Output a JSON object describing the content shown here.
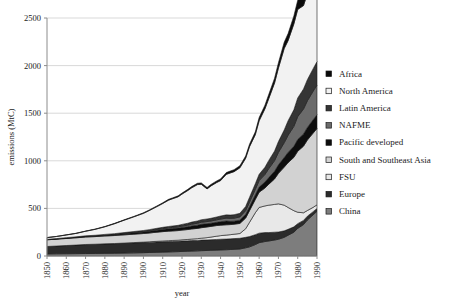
{
  "chart_data": {
    "type": "area",
    "stacked": true,
    "title": "",
    "xlabel": "year",
    "ylabel": "emissions (MtC)",
    "xlim": [
      1850,
      1990
    ],
    "ylim": [
      0,
      2500
    ],
    "ytick_values": [
      0,
      500,
      1000,
      1500,
      2000,
      2500
    ],
    "ytick_labels": [
      "0",
      "500",
      "1000",
      "1500",
      "2000",
      "2500"
    ],
    "xtick_values": [
      1850,
      1860,
      1870,
      1880,
      1890,
      1900,
      1910,
      1920,
      1930,
      1940,
      1950,
      1960,
      1970,
      1980,
      1990
    ],
    "xtick_labels": [
      "1850",
      "1860",
      "1870",
      "1880",
      "1890",
      "1900",
      "1910",
      "1920",
      "1930",
      "1940",
      "1950",
      "1960",
      "1970",
      "1980",
      "1990"
    ],
    "grid": "horizontal",
    "legend_position": "right",
    "x": [
      1850,
      1855,
      1860,
      1865,
      1870,
      1875,
      1880,
      1885,
      1890,
      1895,
      1900,
      1903,
      1905,
      1907,
      1910,
      1913,
      1915,
      1918,
      1920,
      1923,
      1925,
      1928,
      1930,
      1933,
      1935,
      1938,
      1940,
      1943,
      1945,
      1947,
      1950,
      1953,
      1955,
      1958,
      1960,
      1963,
      1965,
      1968,
      1970,
      1973,
      1975,
      1978,
      1980,
      1983,
      1985,
      1988,
      1990
    ],
    "series": [
      {
        "name": "China",
        "color": "#7d7d7d",
        "stack_order": 1,
        "values": [
          22,
          23,
          24,
          25,
          26,
          27,
          28,
          29,
          31,
          33,
          35,
          37,
          38,
          39,
          41,
          43,
          44,
          46,
          48,
          50,
          52,
          54,
          56,
          58,
          60,
          62,
          64,
          66,
          68,
          70,
          74,
          86,
          96,
          120,
          140,
          152,
          158,
          168,
          176,
          196,
          218,
          250,
          290,
          330,
          378,
          432,
          470
        ]
      },
      {
        "name": "Europe",
        "color": "#2b2b2b",
        "stack_order": 2,
        "values": [
          78,
          82,
          86,
          90,
          94,
          96,
          98,
          100,
          102,
          104,
          106,
          106,
          107,
          107,
          108,
          108,
          108,
          108,
          109,
          109,
          110,
          110,
          111,
          111,
          111,
          112,
          112,
          112,
          112,
          113,
          112,
          110,
          108,
          104,
          100,
          94,
          88,
          82,
          76,
          68,
          62,
          56,
          50,
          44,
          40,
          34,
          30
        ]
      },
      {
        "name": "FSU",
        "color": "#e8e8e8",
        "stack_order": 3,
        "values": [
          0,
          0,
          0,
          0,
          1,
          1,
          2,
          2,
          3,
          4,
          5,
          6,
          7,
          8,
          9,
          10,
          11,
          12,
          13,
          15,
          16,
          18,
          20,
          24,
          28,
          34,
          38,
          42,
          44,
          46,
          50,
          90,
          150,
          230,
          270,
          280,
          288,
          292,
          296,
          270,
          230,
          170,
          120,
          80,
          60,
          45,
          38
        ]
      },
      {
        "name": "South and Southeast Asia",
        "color": "#d2d2d2",
        "stack_order": 4,
        "values": [
          70,
          72,
          74,
          76,
          78,
          80,
          82,
          84,
          86,
          88,
          90,
          92,
          94,
          96,
          98,
          100,
          100,
          101,
          102,
          104,
          106,
          108,
          110,
          112,
          112,
          112,
          110,
          108,
          106,
          105,
          106,
          112,
          122,
          140,
          160,
          188,
          220,
          268,
          320,
          400,
          470,
          560,
          640,
          700,
          740,
          780,
          800
        ]
      },
      {
        "name": "Pacific developed",
        "color": "#0d0d0d",
        "stack_order": 5,
        "values": [
          2,
          3,
          4,
          5,
          6,
          7,
          8,
          10,
          12,
          14,
          16,
          18,
          19,
          20,
          22,
          24,
          25,
          26,
          28,
          30,
          32,
          34,
          36,
          34,
          33,
          34,
          36,
          40,
          34,
          32,
          34,
          38,
          42,
          48,
          54,
          62,
          70,
          80,
          90,
          100,
          108,
          116,
          124,
          128,
          132,
          140,
          146
        ]
      },
      {
        "name": "NAFME",
        "color": "#6b6b6b",
        "stack_order": 6,
        "values": [
          1,
          1,
          2,
          2,
          3,
          3,
          4,
          4,
          5,
          6,
          7,
          8,
          8,
          9,
          10,
          11,
          12,
          13,
          14,
          16,
          18,
          20,
          22,
          23,
          24,
          26,
          28,
          30,
          31,
          32,
          34,
          40,
          48,
          58,
          68,
          80,
          94,
          112,
          130,
          156,
          180,
          210,
          240,
          262,
          280,
          300,
          312
        ]
      },
      {
        "name": "Latin America",
        "color": "#353535",
        "stack_order": 7,
        "values": [
          2,
          2,
          3,
          3,
          4,
          4,
          5,
          6,
          7,
          8,
          9,
          10,
          11,
          12,
          13,
          14,
          15,
          16,
          18,
          20,
          22,
          24,
          26,
          27,
          28,
          30,
          32,
          34,
          35,
          36,
          38,
          44,
          50,
          58,
          66,
          76,
          86,
          100,
          114,
          134,
          152,
          174,
          196,
          210,
          222,
          236,
          246
        ]
      },
      {
        "name": "North America",
        "color": "#f2f2f2",
        "stack_order": 8,
        "values": [
          18,
          22,
          28,
          36,
          48,
          62,
          80,
          104,
          130,
          154,
          180,
          200,
          214,
          228,
          250,
          276,
          286,
          300,
          318,
          344,
          360,
          382,
          372,
          316,
          340,
          362,
          372,
          426,
          442,
          452,
          478,
          506,
          532,
          516,
          562,
          614,
          650,
          716,
          772,
          856,
          842,
          902,
          930,
          876,
          904,
          950,
          980
        ]
      },
      {
        "name": "Africa",
        "color": "#0a0a0a",
        "stack_order": 9,
        "values": [
          1,
          1,
          1,
          2,
          2,
          3,
          3,
          4,
          4,
          5,
          6,
          6,
          7,
          7,
          8,
          9,
          9,
          10,
          11,
          12,
          13,
          14,
          15,
          15,
          16,
          17,
          18,
          19,
          20,
          21,
          22,
          24,
          26,
          30,
          34,
          38,
          44,
          50,
          56,
          66,
          74,
          84,
          96,
          104,
          112,
          124,
          132
        ]
      }
    ],
    "series_legend_order": [
      "Africa",
      "North America",
      "Latin America",
      "NAFME",
      "Pacific developed",
      "South and Southeast Asia",
      "FSU",
      "Europe",
      "China"
    ],
    "legend_items": [
      {
        "label": "Africa",
        "color": "#0a0a0a"
      },
      {
        "label": "North America",
        "color": "#f2f2f2"
      },
      {
        "label": "Latin America",
        "color": "#353535"
      },
      {
        "label": "NAFME",
        "color": "#6b6b6b"
      },
      {
        "label": "Pacific developed",
        "color": "#0d0d0d"
      },
      {
        "label": "South and Southeast Asia",
        "color": "#d2d2d2"
      },
      {
        "label": "FSU",
        "color": "#e8e8e8"
      },
      {
        "label": "Europe",
        "color": "#2b2b2b"
      },
      {
        "label": "China",
        "color": "#7d7d7d"
      }
    ]
  },
  "layout": {
    "plot_left": 47,
    "plot_right": 317,
    "plot_top": 18,
    "plot_bottom": 256
  }
}
